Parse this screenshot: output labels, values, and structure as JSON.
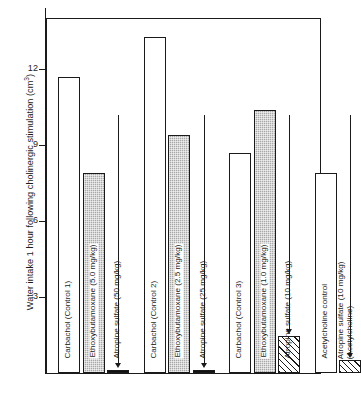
{
  "figure": {
    "y_axis_title": "Water intake 1 hour following cholinergic stimulation (cm",
    "y_axis_title_sup": "3",
    "y_axis_title_close": ")"
  },
  "chart_data": {
    "type": "bar",
    "title": "",
    "xlabel": "",
    "ylabel": "Water intake 1 hour following cholinergic stimulation (cm^3)",
    "ylim": [
      0,
      14.5
    ],
    "yticks": [
      3,
      6,
      9,
      12
    ],
    "ytick_labels": [
      "3",
      "6",
      "9",
      "12"
    ],
    "grid": false,
    "legend": "none",
    "categories": [
      "Carbachol (Control 1)",
      "Ethoxybutamoxane (5.0 mg/kg)",
      "Atropine sulfate (50 mg/kg)",
      "Carbachol (Control 2)",
      "Ethoxybutamoxane (2.5 mg/kg)",
      "Atropine sulfate (25 mg/kg)",
      "Carbachol (Control 3)",
      "Ethoxybutamoxane (1.0 mg/kg)",
      "Atropine sulfate (10 mg/kg)",
      "Acetylcholine control",
      "Atropine sulfate (10 mg/kg) (Acetylcholine)"
    ],
    "values": [
      11.7,
      7.9,
      0.12,
      13.3,
      9.4,
      0.12,
      8.7,
      10.4,
      1.45,
      7.9,
      0.5
    ],
    "bars": [
      {
        "label": "Carbachol (Control 1)",
        "label_line2": "",
        "value": 11.7,
        "fill": "open",
        "boxed": false,
        "arrow": false,
        "group": 1
      },
      {
        "label": "Ethoxybutamoxane (5.0 mg/kg)",
        "label_line2": "",
        "value": 7.9,
        "fill": "stipple",
        "boxed": true,
        "arrow": false,
        "group": 1
      },
      {
        "label": "Atropine sulfate (50 mg/kg)",
        "label_line2": "",
        "value": 0.12,
        "fill": "solid",
        "boxed": false,
        "arrow": true,
        "group": 1
      },
      {
        "label": "Carbachol (Control 2)",
        "label_line2": "",
        "value": 13.3,
        "fill": "open",
        "boxed": false,
        "arrow": false,
        "group": 2
      },
      {
        "label": "Ethoxybutamoxane (2.5 mg/kg)",
        "label_line2": "",
        "value": 9.4,
        "fill": "stipple",
        "boxed": true,
        "arrow": false,
        "group": 2
      },
      {
        "label": "Atropine sulfate (25 mg/kg)",
        "label_line2": "",
        "value": 0.12,
        "fill": "solid",
        "boxed": false,
        "arrow": true,
        "group": 2
      },
      {
        "label": "Carbachol (Control 3)",
        "label_line2": "",
        "value": 8.7,
        "fill": "open",
        "boxed": false,
        "arrow": false,
        "group": 3
      },
      {
        "label": "Ethoxybutamoxane (1.0 mg/kg)",
        "label_line2": "",
        "value": 10.4,
        "fill": "stipple",
        "boxed": true,
        "arrow": false,
        "group": 3
      },
      {
        "label": "Atropine sulfate (10 mg/kg)",
        "label_line2": "",
        "value": 1.45,
        "fill": "hatch",
        "boxed": false,
        "arrow": true,
        "group": 3
      },
      {
        "label": "Acetylcholine control",
        "label_line2": "",
        "value": 7.9,
        "fill": "open",
        "boxed": false,
        "arrow": false,
        "group": 4
      },
      {
        "label": "Atropine sulfate (10 mg/kg)",
        "label_line2": "(Acetylcholine)",
        "value": 0.5,
        "fill": "hatch",
        "boxed": false,
        "arrow": true,
        "group": 4
      }
    ]
  }
}
